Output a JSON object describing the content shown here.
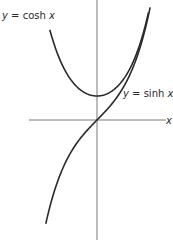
{
  "chart_data": {
    "type": "line",
    "title": "",
    "xlabel": "x",
    "ylabel": "",
    "grid": false,
    "xlim": [
      -2.8,
      2.9
    ],
    "ylim": [
      -5.0,
      5.0
    ],
    "series": [
      {
        "name": "y = cosh x",
        "function": "cosh",
        "x_range": [
          -2.0,
          2.18
        ]
      },
      {
        "name": "y = sinh x",
        "function": "sinh",
        "x_range": [
          -2.17,
          2.25
        ]
      }
    ],
    "annotations": [
      {
        "text": "y = cosh x",
        "position": "upper-left"
      },
      {
        "text": "y = sinh x",
        "position": "right, above x-axis"
      }
    ]
  },
  "labels": {
    "cosh_prefix": "y",
    "cosh_eq": " = cosh ",
    "cosh_var": "x",
    "sinh_prefix": "y",
    "sinh_eq": " = sinh ",
    "sinh_var": "x",
    "x_axis": "x"
  },
  "colors": {
    "curve": "#2a2a2a",
    "axis": "#555555"
  }
}
